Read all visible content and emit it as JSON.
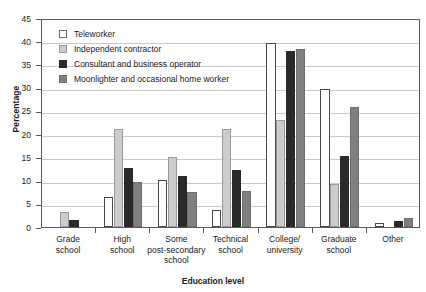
{
  "chart_data": {
    "type": "bar",
    "title": "",
    "xlabel": "Education level",
    "ylabel": "Percentage",
    "ylim": [
      0,
      45
    ],
    "ytick_step": 5,
    "yticks": [
      0,
      5,
      10,
      15,
      20,
      25,
      30,
      35,
      40,
      45
    ],
    "grid": "horizontal",
    "legend_position": "inside-top-left",
    "categories": [
      "Grade school",
      "High school",
      "Some post-secondary school",
      "Technical school",
      "College/ university",
      "Graduate school",
      "Other"
    ],
    "category_label_lines": [
      [
        "Grade",
        "school"
      ],
      [
        "High",
        "school"
      ],
      [
        "Some",
        "post-secondary",
        "school"
      ],
      [
        "Technical",
        "school"
      ],
      [
        "College/",
        "university"
      ],
      [
        "Graduate",
        "school"
      ],
      [
        "Other"
      ]
    ],
    "series": [
      {
        "name": "Teleworker",
        "color": "#ffffff",
        "edge_color": "#4a4a4a",
        "values": [
          0,
          6.5,
          10.2,
          3.7,
          39.6,
          29.7,
          0.8
        ]
      },
      {
        "name": "Independent contractor",
        "color": "#cccccc",
        "edge_color": "#9a9a9a",
        "values": [
          3.2,
          21.0,
          15.0,
          21.0,
          23.0,
          9.2,
          0
        ]
      },
      {
        "name": "Consultant and business operator",
        "color": "#2a2a2a",
        "edge_color": "#2a2a2a",
        "values": [
          1.5,
          12.7,
          11.0,
          12.3,
          37.8,
          15.2,
          1.3
        ]
      },
      {
        "name": "Moonlighter and occasional home worker",
        "color": "#808080",
        "edge_color": "#6e6e6e",
        "values": [
          0,
          9.6,
          7.6,
          7.7,
          38.3,
          25.9,
          1.9
        ]
      }
    ]
  }
}
